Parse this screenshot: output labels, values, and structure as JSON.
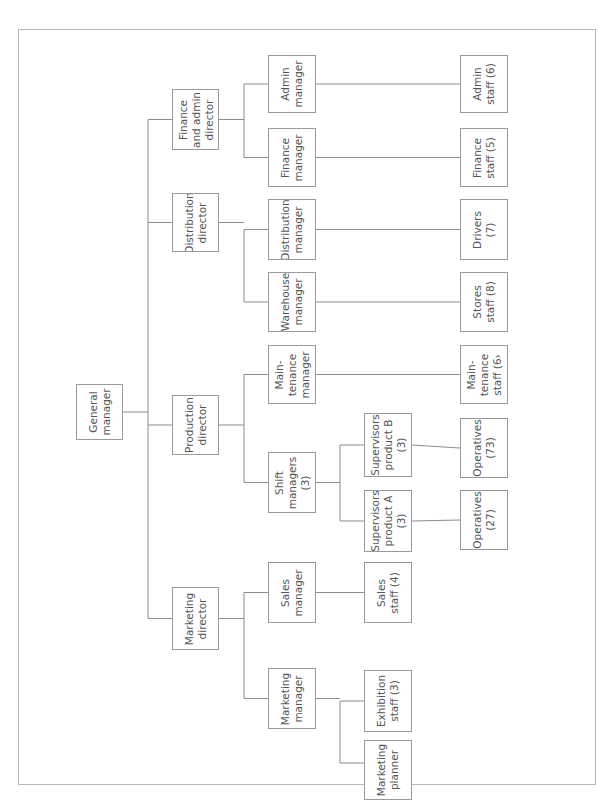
{
  "chart": {
    "orientation": "rotated-90-counterclockwise",
    "root": {
      "id": "gm",
      "label": "General\nmanager"
    },
    "nodes": [
      {
        "id": "gm",
        "label": "General\nmanager",
        "parent": null
      },
      {
        "id": "fin-dir",
        "label": "Finance\nand admin\ndirector",
        "parent": "gm"
      },
      {
        "id": "dist-dir",
        "label": "Distribution\ndirector",
        "parent": "gm"
      },
      {
        "id": "prod-dir",
        "label": "Production\ndirector",
        "parent": "gm"
      },
      {
        "id": "mkt-dir",
        "label": "Marketing\ndirector",
        "parent": "gm"
      },
      {
        "id": "admin-mgr",
        "label": "Admin\nmanager",
        "parent": "fin-dir"
      },
      {
        "id": "fin-mgr",
        "label": "Finance\nmanager",
        "parent": "fin-dir"
      },
      {
        "id": "dist-mgr",
        "label": "Distribution\nmanager",
        "parent": "dist-dir"
      },
      {
        "id": "wh-mgr",
        "label": "Warehouse\nmanager",
        "parent": "dist-dir"
      },
      {
        "id": "maint-mgr",
        "label": "Main-\ntenance\nmanager",
        "parent": "prod-dir"
      },
      {
        "id": "shift-mgr",
        "label": "Shift\nmanagers\n(3)",
        "parent": "prod-dir"
      },
      {
        "id": "sales-mgr",
        "label": "Sales\nmanager",
        "parent": "mkt-dir"
      },
      {
        "id": "mkt-mgr",
        "label": "Marketing\nmanager",
        "parent": "mkt-dir"
      },
      {
        "id": "sup-b",
        "label": "Supervisors\nproduct B\n(3)",
        "parent": "shift-mgr"
      },
      {
        "id": "sup-a",
        "label": "Supervisors\nproduct A\n(3)",
        "parent": "shift-mgr"
      },
      {
        "id": "sales-staff",
        "label": "Sales\nstaff (4)",
        "parent": "sales-mgr"
      },
      {
        "id": "exh-staff",
        "label": "Exhibition\nstaff (3)",
        "parent": "mkt-mgr"
      },
      {
        "id": "mkt-planner",
        "label": "Marketing\nplanner",
        "parent": "mkt-mgr"
      },
      {
        "id": "admin-staff",
        "label": "Admin\nstaff (6)",
        "parent": "admin-mgr"
      },
      {
        "id": "fin-staff",
        "label": "Finance\nstaff (5)",
        "parent": "fin-mgr"
      },
      {
        "id": "drivers",
        "label": "Drivers\n(7)",
        "parent": "dist-mgr"
      },
      {
        "id": "stores-staff",
        "label": "Stores\nstaff (8)",
        "parent": "wh-mgr"
      },
      {
        "id": "maint-staff",
        "label": "Main-\ntenance\nstaff (6›",
        "parent": "maint-mgr"
      },
      {
        "id": "ops-73",
        "label": "Operatives\n(73)",
        "parent": "sup-b"
      },
      {
        "id": "ops-27",
        "label": "Operatives\n(27)",
        "parent": "sup-a"
      }
    ]
  }
}
